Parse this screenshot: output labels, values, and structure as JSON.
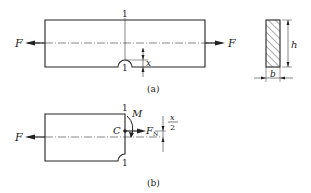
{
  "figure_a": {
    "caption": "(a)",
    "force_left": "F",
    "force_right": "F",
    "section_top_label": "1",
    "section_bottom_label": "1",
    "dimension_x": "x"
  },
  "cross_section": {
    "height_label": "h",
    "width_label": "b"
  },
  "figure_b": {
    "caption": "(b)",
    "force_left": "F",
    "section_top_label": "1",
    "section_bottom_label": "1",
    "centroid_label": "C",
    "moment_label": "M",
    "normal_force_label": "F",
    "normal_force_subscript": "N",
    "dimension_numerator": "x",
    "dimension_denominator": "2"
  },
  "colors": {
    "line": "#222222",
    "background": "#ffffff"
  }
}
